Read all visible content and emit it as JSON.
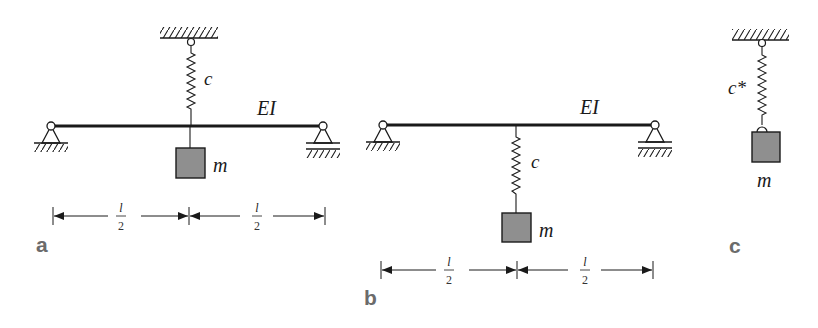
{
  "figure": {
    "panels": [
      {
        "id": "a",
        "label": "a",
        "beam_label": "EI",
        "spring_label": "c",
        "mass_label": "m",
        "spring_position": "above beam, connected to ceiling",
        "mass_position": "hanging directly below beam midspan",
        "dimensions": [
          {
            "numerator": "l",
            "denominator": "2"
          },
          {
            "numerator": "l",
            "denominator": "2"
          }
        ]
      },
      {
        "id": "b",
        "label": "b",
        "beam_label": "EI",
        "spring_label": "c",
        "mass_label": "m",
        "spring_position": "below beam midspan",
        "mass_position": "hanging from spring",
        "dimensions": [
          {
            "numerator": "l",
            "denominator": "2"
          },
          {
            "numerator": "l",
            "denominator": "2"
          }
        ]
      },
      {
        "id": "c",
        "label": "c",
        "spring_label": "c*",
        "mass_label": "m",
        "description": "equivalent single-degree-of-freedom spring-mass system"
      }
    ],
    "colors": {
      "line": "#1a1a1a",
      "mass_fill": "#8f8f8f",
      "panel_label": "#6b6b6b",
      "background": "#ffffff"
    }
  }
}
